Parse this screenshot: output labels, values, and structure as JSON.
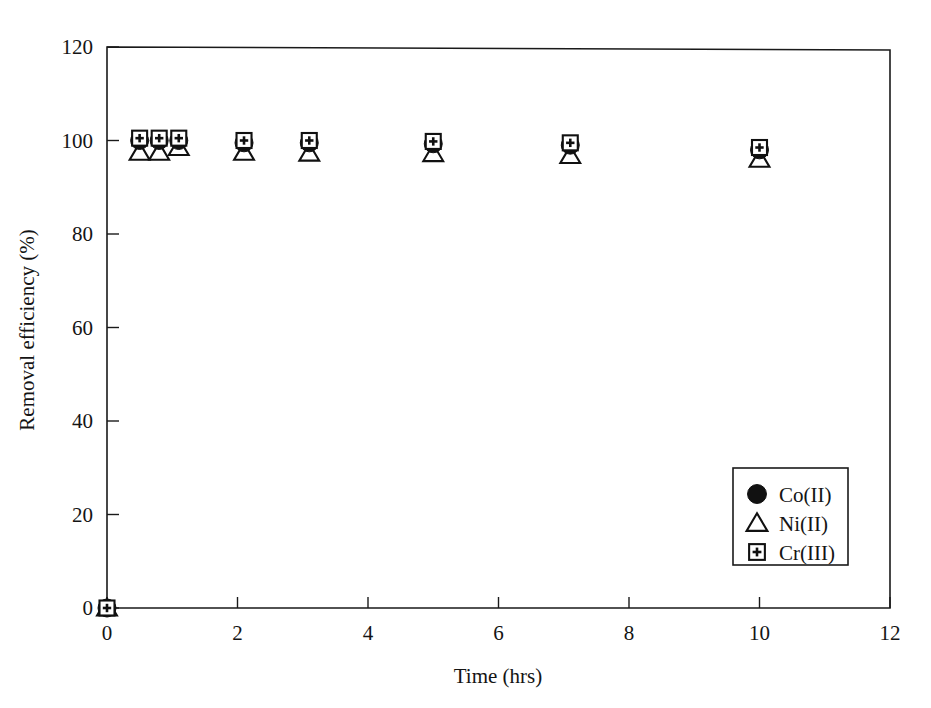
{
  "chart_data": {
    "type": "scatter",
    "title": "",
    "xlabel": "Time (hrs)",
    "ylabel": "Removal efficiency (%)",
    "xlim": [
      0,
      12
    ],
    "ylim": [
      0,
      120
    ],
    "xticks": [
      0,
      2,
      4,
      6,
      8,
      10,
      12
    ],
    "yticks": [
      0,
      20,
      40,
      60,
      80,
      100,
      120
    ],
    "xtick_labels": [
      "0",
      "2",
      "4",
      "6",
      "8",
      "10",
      "12"
    ],
    "ytick_labels": [
      "0",
      "20",
      "40",
      "60",
      "80",
      "100",
      "120"
    ],
    "grid": false,
    "frame": "box",
    "legend_position": "lower-right",
    "series": [
      {
        "name": "Co(II)",
        "marker": "filled-circle",
        "color": "#111111",
        "x": [
          0,
          0.5,
          0.8,
          1.1,
          2.1,
          3.1,
          5.0,
          7.1,
          10.0
        ],
        "y": [
          0,
          100,
          100,
          100,
          99.5,
          99.5,
          99.3,
          99.0,
          98.0
        ]
      },
      {
        "name": "Ni(II)",
        "marker": "open-triangle",
        "color": "#111111",
        "x": [
          0,
          0.5,
          0.8,
          1.1,
          2.1,
          3.1,
          5.0,
          7.1,
          10.0
        ],
        "y": [
          0,
          97.5,
          97.5,
          98.5,
          97.5,
          97.3,
          97.2,
          96.8,
          96.0
        ]
      },
      {
        "name": "Cr(III)",
        "marker": "square-plus",
        "color": "#111111",
        "x": [
          0,
          0.5,
          0.8,
          1.1,
          2.1,
          3.1,
          5.0,
          7.1,
          10.0
        ],
        "y": [
          0,
          100.5,
          100.5,
          100.5,
          100.0,
          100.0,
          99.8,
          99.5,
          98.5
        ]
      }
    ]
  },
  "legend": {
    "entries": [
      {
        "label": "Co(II)",
        "marker": "filled-circle"
      },
      {
        "label": "Ni(II)",
        "marker": "open-triangle"
      },
      {
        "label": "Cr(III)",
        "marker": "square-plus"
      }
    ]
  },
  "axis": {
    "x_title": "Time (hrs)",
    "y_title": "Removal efficiency (%)"
  }
}
